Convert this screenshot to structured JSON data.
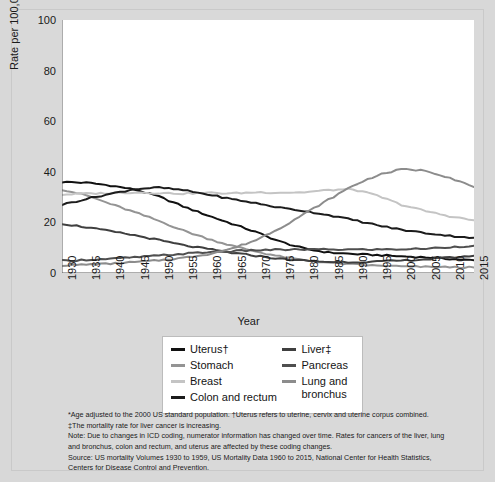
{
  "chart_data": {
    "type": "line",
    "title": "",
    "subtitle": "",
    "xlabel": "Year",
    "ylabel": "Rate per 100,000 Female Population",
    "xlim": [
      1930,
      2015
    ],
    "ylim": [
      0,
      100
    ],
    "yticks": [
      0,
      20,
      40,
      60,
      80,
      100
    ],
    "xticks": [
      1930,
      1935,
      1940,
      1945,
      1950,
      1955,
      1960,
      1965,
      1970,
      1975,
      1980,
      1985,
      1990,
      1995,
      2000,
      2005,
      2010,
      2015
    ],
    "grid": false,
    "legend_position": "below-axes",
    "x": [
      1930,
      1935,
      1940,
      1945,
      1950,
      1955,
      1960,
      1965,
      1970,
      1975,
      1980,
      1985,
      1990,
      1995,
      2000,
      2005,
      2010,
      2015
    ],
    "series": [
      {
        "name": "Uterus†",
        "color": "#111111",
        "values": [
          36.0,
          35.7,
          34.6,
          33.0,
          30.2,
          26.3,
          22.8,
          19.5,
          16.2,
          12.4,
          9.6,
          8.1,
          7.5,
          7.1,
          6.6,
          6.2,
          5.6,
          5.0
        ]
      },
      {
        "name": "Stomach",
        "color": "#949494",
        "values": [
          33.0,
          30.7,
          27.3,
          24.0,
          20.6,
          16.8,
          13.6,
          10.8,
          8.5,
          6.5,
          5.0,
          4.1,
          3.4,
          2.9,
          2.6,
          2.4,
          2.3,
          2.2
        ]
      },
      {
        "name": "Breast",
        "color": "#c4c4c4",
        "values": [
          31.0,
          31.4,
          31.6,
          31.9,
          31.6,
          31.4,
          31.7,
          31.5,
          31.9,
          31.8,
          31.9,
          32.8,
          33.1,
          30.6,
          27.0,
          24.5,
          22.4,
          20.8
        ]
      },
      {
        "name": "Colon and rectum",
        "color": "#1c1c1c",
        "values": [
          27.0,
          29.3,
          31.3,
          33.2,
          33.8,
          32.7,
          31.1,
          29.2,
          27.6,
          25.8,
          24.5,
          22.9,
          21.0,
          18.9,
          17.1,
          15.8,
          14.7,
          13.9
        ]
      },
      {
        "name": "Liver‡",
        "color": "#3f3f3f",
        "values": [
          19.5,
          18.1,
          16.5,
          14.9,
          13.0,
          11.0,
          9.5,
          8.0,
          6.8,
          5.6,
          4.9,
          4.4,
          4.3,
          4.5,
          4.9,
          5.4,
          6.1,
          6.8
        ]
      },
      {
        "name": "Pancreas",
        "color": "#4f4f4f",
        "values": [
          4.8,
          5.2,
          5.6,
          6.2,
          6.9,
          7.6,
          8.2,
          8.6,
          9.0,
          9.2,
          9.3,
          9.3,
          9.3,
          9.3,
          9.4,
          9.6,
          10.2,
          10.8
        ]
      },
      {
        "name": "Lung and bronchus",
        "color": "#8c8c8c",
        "values": [
          3.0,
          3.3,
          3.7,
          4.3,
          5.0,
          6.0,
          7.4,
          9.6,
          13.0,
          17.8,
          23.4,
          29.0,
          34.5,
          38.6,
          41.0,
          40.5,
          37.7,
          34.0
        ]
      }
    ]
  },
  "legend": {
    "left_column": [
      {
        "label": "Uterus†",
        "color": "#111111"
      },
      {
        "label": "Stomach",
        "color": "#949494"
      },
      {
        "label": "Breast",
        "color": "#c4c4c4"
      },
      {
        "label": "Colon and rectum",
        "color": "#1c1c1c"
      }
    ],
    "right_column": [
      {
        "label": "Liver‡",
        "color": "#3f3f3f"
      },
      {
        "label": "Pancreas",
        "color": "#4f4f4f"
      },
      {
        "label": "Lung and bronchus",
        "color": "#8c8c8c"
      }
    ]
  },
  "notes": {
    "line1": "*Age adjusted to the 2000 US standard population. †Uterus refers to uterine, cervix and uterine corpus combined.",
    "line2": "‡The mortality rate for liver cancer is increasing.",
    "line3": "Note: Due to changes in ICD coding, numerator information has changed over time. Rates for cancers of the liver, lung",
    "line4": "and bronchus, colon and rectum, and uterus are affected by these coding changes.",
    "line5": "Source: US mortality Volumes 1930 to 1959, US Mortality Data 1960 to 2015, National Center for Health Statistics,",
    "line6": "Centers for Disease Control and Prevention."
  }
}
